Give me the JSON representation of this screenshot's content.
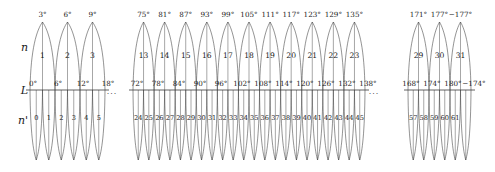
{
  "figure": {
    "type": "number-line-arc-diagram",
    "axis_label": "L",
    "upper_row_label": "n",
    "lower_row_label": "n'",
    "baseline_y": 90,
    "ellipsis": "...",
    "colors": {
      "stroke": "#3a3a3a",
      "text": "#1a1a1a",
      "background": "#ffffff"
    }
  },
  "groups": [
    {
      "id": "left",
      "x_start": 30,
      "x_end": 105,
      "upper_peak_labels": [
        "3°",
        "6°",
        "9°"
      ],
      "upper_peak_x": [
        42,
        67,
        92
      ],
      "upper_numbers": [
        "1",
        "2",
        "3"
      ],
      "baseline_labels": [
        "0°",
        "6°",
        "12°",
        "18°"
      ],
      "baseline_label_x": [
        30,
        55,
        80,
        105
      ],
      "lower_numbers": [
        "0",
        "1",
        "2",
        "3",
        "4",
        "5"
      ],
      "lower_number_x": [
        34,
        46,
        58,
        70,
        82,
        94
      ],
      "tick_count": 7,
      "upper_arc_count": 3,
      "lower_arc_count": 6
    },
    {
      "id": "middle",
      "x_start": 133,
      "x_end": 365,
      "upper_peak_labels": [
        "75°",
        "81°",
        "87°",
        "93°",
        "99°",
        "105°",
        "111°",
        "117°",
        "123°",
        "129°",
        "135°"
      ],
      "upper_peak_x": [
        145,
        166,
        187,
        208,
        229,
        250,
        271,
        292,
        313,
        334,
        355
      ],
      "upper_numbers": [
        "13",
        "14",
        "15",
        "16",
        "17",
        "18",
        "19",
        "20",
        "21",
        "22",
        "23"
      ],
      "baseline_labels": [
        "72°",
        "78°",
        "84°",
        "90°",
        "96°",
        "102°",
        "108°",
        "114°",
        "120°",
        "126°",
        "132°",
        "138°"
      ],
      "baseline_label_x": [
        134,
        155,
        176,
        197,
        218,
        239,
        260,
        281,
        302,
        323,
        344,
        365
      ],
      "lower_numbers": [
        "24",
        "25",
        "26",
        "27",
        "28",
        "29",
        "30",
        "31",
        "32",
        "33",
        "34",
        "35",
        "36",
        "37",
        "38",
        "39",
        "40",
        "41",
        "42",
        "43",
        "44",
        "45",
        "46"
      ],
      "tick_count": 23,
      "upper_arc_count": 11,
      "lower_arc_count": 22
    },
    {
      "id": "right",
      "x_start": 408,
      "x_end": 471,
      "upper_peak_labels": [
        "171°",
        "177°",
        "−177°"
      ],
      "upper_peak_x": [
        419,
        440,
        461
      ],
      "upper_numbers": [
        "29",
        "30",
        "31"
      ],
      "baseline_labels": [
        "168°",
        "174°",
        "180°",
        "−174°"
      ],
      "baseline_label_x": [
        408,
        429,
        450,
        471
      ],
      "lower_numbers": [
        "57",
        "58",
        "59",
        "60",
        "61"
      ],
      "lower_number_x": [
        414,
        424,
        434,
        444,
        454
      ],
      "tick_count": 7,
      "upper_arc_count": 3,
      "lower_arc_count": 6
    }
  ],
  "ellipses": [
    {
      "id": "gap-left",
      "x": 112,
      "y": 92
    },
    {
      "id": "gap-right",
      "x": 374,
      "y": 92
    }
  ]
}
